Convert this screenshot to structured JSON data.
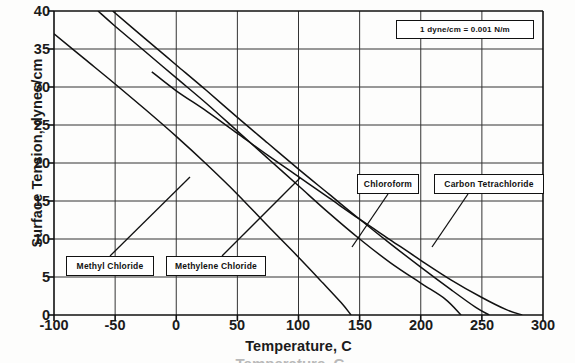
{
  "chart_data": {
    "type": "line",
    "title": "",
    "xlabel": "Temperature, C",
    "ylabel": "Surface Tension, dynes/cm",
    "xlim": [
      -100,
      300
    ],
    "ylim": [
      0,
      40
    ],
    "xticks": [
      -100,
      -50,
      0,
      50,
      100,
      150,
      200,
      250,
      300
    ],
    "yticks": [
      0,
      5,
      10,
      15,
      20,
      25,
      30,
      35,
      40
    ],
    "grid": true,
    "legend": "callout-labels-with-leader-lines",
    "annotation": "1 dyne/cm = 0.001 N/m",
    "series": [
      {
        "name": "Methyl Chloride",
        "points": [
          [
            -100,
            37.0
          ],
          [
            -75,
            33.7
          ],
          [
            -50,
            30.4
          ],
          [
            -25,
            27.0
          ],
          [
            0,
            23.5
          ],
          [
            25,
            19.8
          ],
          [
            50,
            15.9
          ],
          [
            75,
            11.7
          ],
          [
            100,
            7.6
          ],
          [
            120,
            4.2
          ],
          [
            135,
            1.6
          ],
          [
            143,
            0.0
          ]
        ]
      },
      {
        "name": "Methylene Chloride",
        "points": [
          [
            -64,
            40.0
          ],
          [
            -50,
            38.0
          ],
          [
            -25,
            34.6
          ],
          [
            0,
            31.2
          ],
          [
            25,
            27.8
          ],
          [
            50,
            24.2
          ],
          [
            75,
            20.6
          ],
          [
            100,
            17.0
          ],
          [
            125,
            13.4
          ],
          [
            150,
            10.0
          ],
          [
            175,
            6.9
          ],
          [
            200,
            4.2
          ],
          [
            220,
            2.1
          ],
          [
            233,
            0.0
          ]
        ]
      },
      {
        "name": "Chloroform",
        "points": [
          [
            -52,
            40.0
          ],
          [
            -25,
            36.3
          ],
          [
            0,
            32.9
          ],
          [
            25,
            29.5
          ],
          [
            50,
            26.0
          ],
          [
            75,
            22.6
          ],
          [
            100,
            19.2
          ],
          [
            125,
            15.9
          ],
          [
            150,
            12.6
          ],
          [
            175,
            9.4
          ],
          [
            200,
            6.3
          ],
          [
            225,
            3.3
          ],
          [
            245,
            1.0
          ],
          [
            256,
            0.0
          ]
        ]
      },
      {
        "name": "Carbon Tetrachloride",
        "points": [
          [
            -20,
            32.0
          ],
          [
            0,
            29.5
          ],
          [
            25,
            26.8
          ],
          [
            50,
            23.9
          ],
          [
            75,
            21.0
          ],
          [
            100,
            18.2
          ],
          [
            125,
            15.4
          ],
          [
            150,
            12.6
          ],
          [
            175,
            9.9
          ],
          [
            200,
            7.2
          ],
          [
            225,
            4.6
          ],
          [
            250,
            2.3
          ],
          [
            270,
            0.7
          ],
          [
            283,
            0.0
          ]
        ]
      }
    ]
  },
  "axes": {
    "y_title": "Surface Tension, dynes/cm",
    "x_title": "Temperature, C",
    "y_tick_labels": [
      "40",
      "35",
      "30",
      "25",
      "20",
      "15",
      "10",
      "5",
      "0"
    ],
    "x_tick_labels": [
      "-100",
      "-50",
      "0",
      "50",
      "100",
      "150",
      "200",
      "250",
      "300"
    ]
  },
  "annotations": {
    "unit_note": "1 dyne/cm = 0.001 N/m"
  },
  "labels": {
    "methyl_chloride": "Methyl  Chloride",
    "methylene_chloride": "Methylene Chloride",
    "chloroform": "Chloroform",
    "carbon_tetrachloride": "Carbon Tetrachloride"
  },
  "caption_sliver": "Temperature, C"
}
